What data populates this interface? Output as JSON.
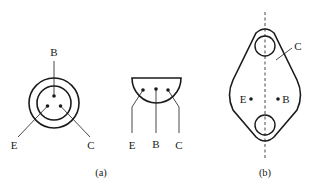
{
  "figure": {
    "colors": {
      "ink": "#1a1a1a",
      "background": "#ffffff"
    },
    "panel_a": {
      "caption": "(a)",
      "round_case": {
        "pins": {
          "top": "B",
          "left": "E",
          "right": "C"
        }
      },
      "half_round_case": {
        "pins": {
          "left": "E",
          "middle": "B",
          "right": "C"
        }
      }
    },
    "panel_b": {
      "caption": "(b)",
      "case_label": "C",
      "pins": {
        "left": "E",
        "right": "B"
      }
    }
  }
}
